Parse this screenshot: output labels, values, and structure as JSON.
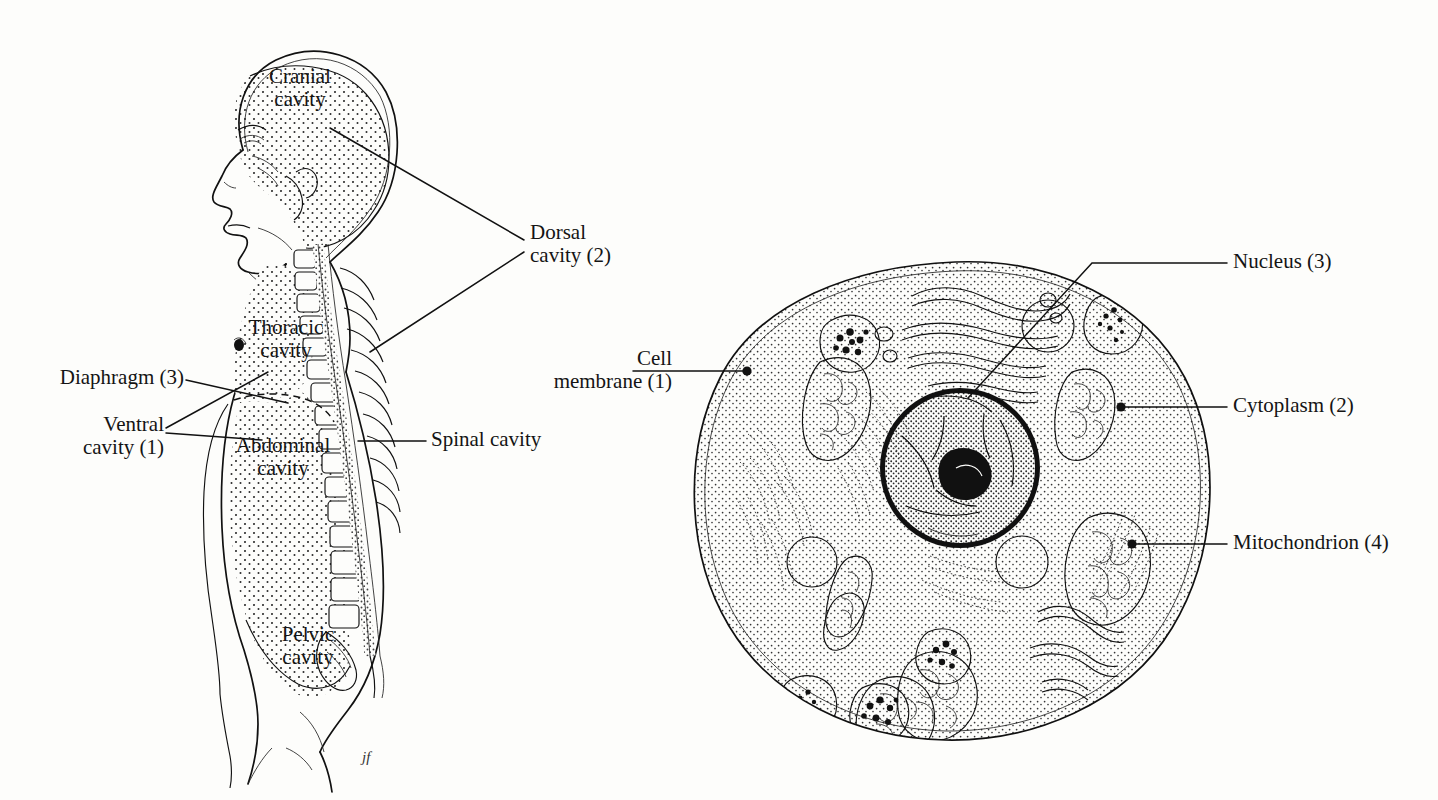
{
  "figure": {
    "background_color": "#fdfdfb",
    "ink_color": "#111111",
    "signature": "jf"
  },
  "panels": [
    {
      "id": "body-cavities",
      "title": "Human body cavities, lateral view"
    },
    {
      "id": "animal-cell",
      "title": "Animal cell, cross section"
    }
  ],
  "body_cavities": {
    "labels": {
      "cranial": {
        "line1": "Cranial",
        "line2": "cavity"
      },
      "thoracic": {
        "line1": "Thoracic",
        "line2": "cavity"
      },
      "abdominal": {
        "line1": "Abdominal",
        "line2": "cavity"
      },
      "pelvic": {
        "line1": "Pelvic",
        "line2": "cavity"
      },
      "dorsal": {
        "line1": "Dorsal",
        "line2": "cavity (2)"
      },
      "ventral": {
        "line1": "Ventral",
        "line2": "cavity (1)"
      },
      "diaphragm": {
        "line1": "Diaphragm (3)"
      },
      "spinal": {
        "line1": "Spinal cavity"
      }
    }
  },
  "animal_cell": {
    "labels": {
      "cell_membrane": {
        "line1": "Cell",
        "line2": "membrane (1)"
      },
      "cytoplasm": {
        "line1": "Cytoplasm (2)"
      },
      "nucleus": {
        "line1": "Nucleus (3)"
      },
      "mitochondrion": {
        "line1": "Mitochondrion (4)"
      }
    }
  },
  "legend_numbers": {
    "1": "Ventral cavity / Cell membrane",
    "2": "Dorsal cavity / Cytoplasm",
    "3": "Diaphragm / Nucleus",
    "4": "Mitochondrion"
  }
}
